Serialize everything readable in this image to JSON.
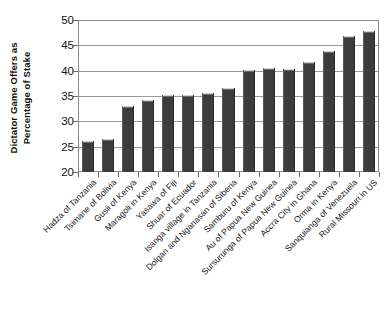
{
  "chart_data": {
    "type": "bar",
    "title": "",
    "xlabel": "",
    "ylabel": "Dictator Game Offers as Percentage of Stake",
    "ylabel_line1": "Dictator Game Offers as",
    "ylabel_line2": "Percentage of Stake",
    "ylim": [
      20,
      50
    ],
    "yticks": [
      20,
      25,
      30,
      35,
      40,
      45,
      50
    ],
    "ytick_labels": [
      "20",
      "25",
      "30",
      "35",
      "40",
      "45",
      "50"
    ],
    "grid": true,
    "legend": "none",
    "bar_color": "#3c3c3c",
    "categories": [
      "Hadza of Tanzania",
      "Tsimane of Bolivia",
      "Gusii of Kenya",
      "Maragoli in Kenya",
      "Yasawa of Fiji",
      "Shuar of Ecuador",
      "Isanga village in Tanzania",
      "Dolgan and Nganasan of Siberia",
      "Samburu of Kenya",
      "Au of Papua New Guinea",
      "Sursurunga of Papua New Guinea",
      "Accra City in Ghana",
      "Orma in Kenya",
      "Sanquianga of Venezuela",
      "Rural Missouri in US"
    ],
    "values": [
      26.2,
      26.6,
      33.0,
      34.3,
      35.2,
      35.2,
      35.5,
      36.5,
      40.2,
      40.5,
      40.4,
      41.8,
      43.8,
      46.9,
      47.8
    ]
  }
}
